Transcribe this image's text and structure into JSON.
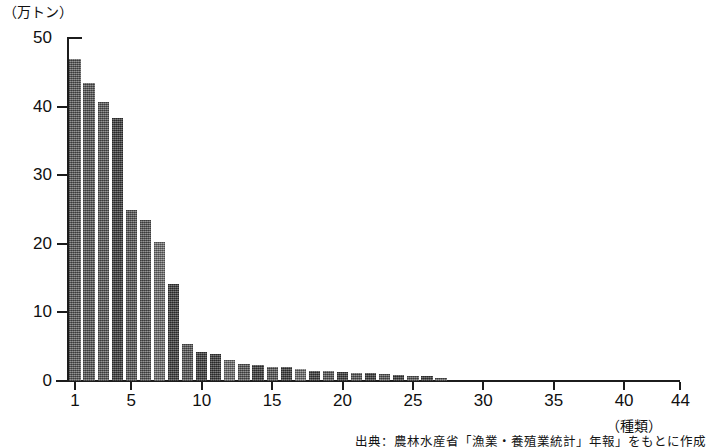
{
  "chart_data": {
    "type": "bar",
    "title": "",
    "subtitle": "",
    "xlabel": "(種類)",
    "ylabel": "(万トン)",
    "ylim": [
      0,
      50
    ],
    "xlim": [
      1,
      44
    ],
    "grid": false,
    "legend": null,
    "y_ticks": [
      0,
      10,
      20,
      30,
      40,
      50
    ],
    "y_tick_labels": [
      "0",
      "10",
      "20",
      "30",
      "40",
      "50"
    ],
    "x_ticks": [
      1,
      5,
      10,
      15,
      20,
      25,
      30,
      35,
      40,
      44
    ],
    "x_tick_labels": [
      "1",
      "5",
      "10",
      "15",
      "20",
      "25",
      "30",
      "35",
      "40",
      "44"
    ],
    "categories": [
      1,
      2,
      3,
      4,
      5,
      6,
      7,
      8,
      9,
      10,
      11,
      12,
      13,
      14,
      15,
      16,
      17,
      18,
      19,
      20,
      21,
      22,
      23,
      24,
      25,
      26,
      27,
      28,
      29,
      30,
      31,
      32,
      33,
      34,
      35,
      36,
      37,
      38,
      39,
      40,
      41,
      42,
      43,
      44
    ],
    "values": [
      47.0,
      43.5,
      40.6,
      38.4,
      25.0,
      23.4,
      20.3,
      14.2,
      5.4,
      4.3,
      4.0,
      3.0,
      2.5,
      2.3,
      2.1,
      2.0,
      1.7,
      1.5,
      1.4,
      1.3,
      1.2,
      1.1,
      1.0,
      0.9,
      0.8,
      0.7,
      0.5,
      0,
      0,
      0,
      0,
      0,
      0,
      0,
      0,
      0,
      0,
      0,
      0,
      0,
      0,
      0,
      0,
      0
    ],
    "shades": [
      "mid",
      "mid",
      "mid",
      "dark",
      "mid",
      "mid",
      "light",
      "dark",
      "mid",
      "dark",
      "dark",
      "light",
      "mid",
      "dark",
      "mid",
      "dark",
      "light",
      "dark",
      "mid",
      "dark",
      "mid",
      "dark",
      "mid",
      "dark",
      "mid",
      "dark",
      "mid",
      "mid",
      "mid",
      "mid",
      "mid",
      "mid",
      "mid",
      "mid",
      "mid",
      "mid",
      "mid",
      "mid",
      "mid",
      "mid",
      "mid",
      "mid",
      "mid",
      "mid"
    ]
  },
  "labels": {
    "y_unit": "（万トン）",
    "x_unit": "（種類）"
  },
  "source": {
    "note": "出典：農林水産省「漁業・養殖業統計」年報」をもとに作成"
  },
  "colors": {
    "axis": "#1c1c1c",
    "text": "#101010",
    "bar_mid": "#6b6b6b",
    "bar_dark": "#4a4a4a",
    "bar_light": "#898989",
    "background": "#ffffff"
  }
}
